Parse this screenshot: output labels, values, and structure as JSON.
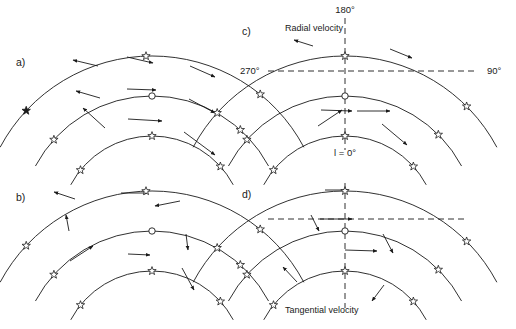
{
  "figure": {
    "width": 516,
    "height": 329,
    "background": "#ffffff",
    "ink": "#1a1a1a"
  },
  "panels": [
    {
      "id": "a",
      "label": "a)",
      "label_pos": [
        16,
        66
      ],
      "kind": "radial-velocity-no-axes",
      "center": [
        152,
        228
      ],
      "radii": [
        172,
        132,
        92
      ],
      "arc_span_deg": [
        208,
        332
      ],
      "stars": [
        {
          "arc": 0,
          "angle_deg": 223,
          "style": "filled"
        },
        {
          "arc": 0,
          "angle_deg": 268,
          "style": "open"
        },
        {
          "arc": 0,
          "angle_deg": 309,
          "style": "open"
        },
        {
          "arc": 1,
          "angle_deg": 222,
          "style": "open"
        },
        {
          "arc": 1,
          "angle_deg": 270,
          "style": "sun"
        },
        {
          "arc": 1,
          "angle_deg": 312,
          "style": "open"
        },
        {
          "arc": 2,
          "angle_deg": 219,
          "style": "open"
        },
        {
          "arc": 2,
          "angle_deg": 270,
          "style": "open"
        },
        {
          "arc": 2,
          "angle_deg": 318,
          "style": "open"
        }
      ],
      "vectors": [
        {
          "from": [
            98,
            66
          ],
          "to": [
            73,
            60
          ],
          "head": true
        },
        {
          "from": [
            127,
            57
          ],
          "to": [
            153,
            63
          ],
          "head": true
        },
        {
          "from": [
            190,
            66
          ],
          "to": [
            215,
            77
          ],
          "head": true
        },
        {
          "from": [
            100,
            98
          ],
          "to": [
            76,
            91
          ],
          "head": true
        },
        {
          "from": [
            127,
            89
          ],
          "to": [
            156,
            90
          ],
          "head": true
        },
        {
          "from": [
            189,
            99
          ],
          "to": [
            215,
            113
          ],
          "head": true
        },
        {
          "from": [
            105,
            128
          ],
          "to": [
            83,
            108
          ],
          "head": true
        },
        {
          "from": [
            128,
            119
          ],
          "to": [
            162,
            121
          ],
          "head": true
        },
        {
          "from": [
            184,
            132
          ],
          "to": [
            215,
            155
          ],
          "head": true
        }
      ]
    },
    {
      "id": "b",
      "label": "b)",
      "label_pos": [
        16,
        201
      ],
      "kind": "tangential-velocity-no-axes",
      "center": [
        152,
        363
      ],
      "radii": [
        172,
        132,
        92
      ],
      "arc_span_deg": [
        208,
        332
      ],
      "stars": [
        {
          "arc": 0,
          "angle_deg": 223,
          "style": "open"
        },
        {
          "arc": 0,
          "angle_deg": 268,
          "style": "open"
        },
        {
          "arc": 0,
          "angle_deg": 309,
          "style": "open"
        },
        {
          "arc": 1,
          "angle_deg": 222,
          "style": "open"
        },
        {
          "arc": 1,
          "angle_deg": 270,
          "style": "sun"
        },
        {
          "arc": 1,
          "angle_deg": 312,
          "style": "open"
        },
        {
          "arc": 2,
          "angle_deg": 219,
          "style": "open"
        },
        {
          "arc": 2,
          "angle_deg": 270,
          "style": "open"
        },
        {
          "arc": 2,
          "angle_deg": 318,
          "style": "open"
        }
      ],
      "vectors": [
        {
          "from": [
            75,
            199
          ],
          "to": [
            54,
            192
          ],
          "head": true
        },
        {
          "from": [
            121,
            193
          ],
          "to": [
            148,
            193
          ],
          "head": true
        },
        {
          "from": [
            180,
            201
          ],
          "to": [
            155,
            206
          ],
          "head": true
        },
        {
          "from": [
            69,
            231
          ],
          "to": [
            66,
            215
          ],
          "head": true
        },
        {
          "from": [
            70,
            261
          ],
          "to": [
            93,
            246
          ],
          "head": true
        },
        {
          "from": [
            186,
            234
          ],
          "to": [
            188,
            250
          ],
          "head": true
        },
        {
          "from": [
            128,
            254
          ],
          "to": [
            150,
            255
          ],
          "head": true
        },
        {
          "from": [
            182,
            268
          ],
          "to": [
            194,
            290
          ],
          "head": true
        }
      ]
    },
    {
      "id": "c",
      "label": "c)",
      "label_pos": [
        242,
        35
      ],
      "kind": "radial-velocity",
      "caption": "Radial velocity",
      "caption_pos": [
        285,
        31
      ],
      "center": [
        345,
        228
      ],
      "radii": [
        172,
        132,
        92
      ],
      "arc_span_deg": [
        208,
        332
      ],
      "axis_labels": [
        {
          "text": "180°",
          "pos": [
            345,
            13
          ],
          "anchor": "middle"
        },
        {
          "text": "270°",
          "pos": [
            240,
            74
          ],
          "anchor": "start"
        },
        {
          "text": "90°",
          "pos": [
            487,
            74
          ],
          "anchor": "start"
        },
        {
          "text": "l = 0°",
          "pos": [
            345,
            156
          ],
          "anchor": "middle"
        }
      ],
      "vertical_axis": {
        "x": 345,
        "y1": 18,
        "y2": 150
      },
      "horizontal_axis": {
        "y": 71,
        "x1": 268,
        "x2": 478
      },
      "stars": [
        {
          "arc": 0,
          "angle_deg": 222,
          "style": "open"
        },
        {
          "arc": 0,
          "angle_deg": 270,
          "style": "open"
        },
        {
          "arc": 0,
          "angle_deg": 315,
          "style": "open"
        },
        {
          "arc": 1,
          "angle_deg": 222,
          "style": "open"
        },
        {
          "arc": 1,
          "angle_deg": 270,
          "style": "sun"
        },
        {
          "arc": 1,
          "angle_deg": 315,
          "style": "open"
        },
        {
          "arc": 2,
          "angle_deg": 219,
          "style": "open"
        },
        {
          "arc": 2,
          "angle_deg": 270,
          "style": "open"
        },
        {
          "arc": 2,
          "angle_deg": 318,
          "style": "open"
        }
      ],
      "vectors": [
        {
          "from": [
            313,
            46
          ],
          "to": [
            294,
            40
          ],
          "head": true
        },
        {
          "from": [
            390,
            49
          ],
          "to": [
            412,
            58
          ],
          "head": true
        },
        {
          "from": [
            321,
            110
          ],
          "to": [
            352,
            111
          ],
          "head": true
        },
        {
          "from": [
            357,
            111
          ],
          "to": [
            390,
            111
          ],
          "head": true
        },
        {
          "from": [
            318,
            126
          ],
          "to": [
            342,
            110
          ],
          "head": true
        },
        {
          "from": [
            382,
            124
          ],
          "to": [
            407,
            145
          ],
          "head": true
        }
      ]
    },
    {
      "id": "d",
      "label": "d)",
      "label_pos": [
        242,
        198
      ],
      "kind": "tangential-velocity",
      "caption": "Tangential velocity",
      "caption_pos": [
        285,
        313
      ],
      "center": [
        345,
        363
      ],
      "radii": [
        172,
        132,
        92
      ],
      "arc_span_deg": [
        208,
        332
      ],
      "vertical_axis": {
        "x": 345,
        "y1": 183,
        "y2": 308
      },
      "horizontal_axis": {
        "y": 219,
        "x1": 268,
        "x2": 468
      },
      "stars": [
        {
          "arc": 0,
          "angle_deg": 222,
          "style": "open"
        },
        {
          "arc": 0,
          "angle_deg": 270,
          "style": "open"
        },
        {
          "arc": 0,
          "angle_deg": 315,
          "style": "open"
        },
        {
          "arc": 1,
          "angle_deg": 222,
          "style": "open"
        },
        {
          "arc": 1,
          "angle_deg": 270,
          "style": "sun"
        },
        {
          "arc": 1,
          "angle_deg": 315,
          "style": "open"
        },
        {
          "arc": 2,
          "angle_deg": 219,
          "style": "open"
        },
        {
          "arc": 2,
          "angle_deg": 270,
          "style": "open"
        },
        {
          "arc": 2,
          "angle_deg": 318,
          "style": "open"
        }
      ],
      "vectors": [
        {
          "from": [
            325,
            190
          ],
          "to": [
            348,
            190
          ],
          "head": true
        },
        {
          "from": [
            311,
            215
          ],
          "to": [
            319,
            231
          ],
          "head": true
        },
        {
          "from": [
            320,
            219
          ],
          "to": [
            352,
            219
          ],
          "head": true
        },
        {
          "from": [
            383,
            234
          ],
          "to": [
            393,
            253
          ],
          "head": true
        },
        {
          "from": [
            345,
            250
          ],
          "to": [
            377,
            251
          ],
          "head": true
        },
        {
          "from": [
            297,
            282
          ],
          "to": [
            283,
            267
          ],
          "head": true
        },
        {
          "from": [
            384,
            285
          ],
          "to": [
            372,
            301
          ],
          "head": true
        }
      ]
    }
  ],
  "markers": {
    "star_radius_outer": 4.4,
    "star_radius_inner": 1.8,
    "sun_radius": 3.2
  }
}
